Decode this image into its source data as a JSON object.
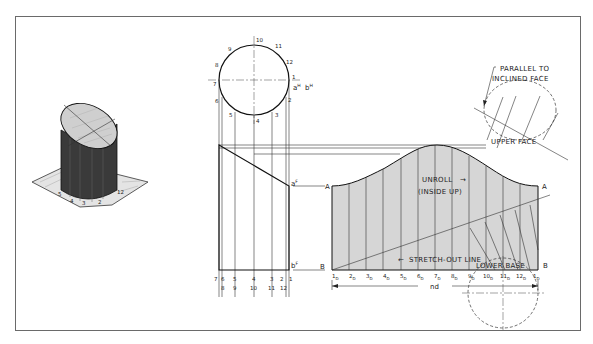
{
  "figure": {
    "pictorial": {
      "name": "isometric-cylinder",
      "base_labels": [
        "5",
        "4",
        "3",
        "2",
        "12"
      ]
    },
    "top_view": {
      "circle_labels": [
        "10",
        "11",
        "12",
        "1",
        "2",
        "3",
        "4",
        "5",
        "6",
        "7",
        "8",
        "9"
      ],
      "point_label_a": "a",
      "point_label_a_sup": "H",
      "point_label_b": "b",
      "point_label_b_sup": "H"
    },
    "front_view": {
      "label_a": "a",
      "label_a_sup": "F",
      "label_b": "b",
      "label_b_sup": "F",
      "bottom_row1": [
        "7",
        "6",
        "5",
        "4",
        "3",
        "2",
        "1"
      ],
      "bottom_row2": [
        "8",
        "9",
        "10",
        "11",
        "12"
      ]
    },
    "development": {
      "label_A_left": "A",
      "label_A_right": "A",
      "label_B_left": "B",
      "label_B_right": "B",
      "unroll_line1": "UNROLL",
      "unroll_line2": "(INSIDE UP)",
      "stretch_out": "STRETCH-OUT LINE",
      "dimension": "nd",
      "stations": [
        "1",
        "2",
        "3",
        "4",
        "5",
        "6",
        "7",
        "8",
        "9",
        "10",
        "11",
        "12",
        "1"
      ],
      "station_sub": "D",
      "fill_color": "#d6d6d6"
    },
    "annotations": {
      "parallel_line1": "PARALLEL TO",
      "parallel_line2": "INCLINED FACE",
      "upper_face": "UPPER FACE",
      "lower_base": "LOWER BASE"
    }
  }
}
